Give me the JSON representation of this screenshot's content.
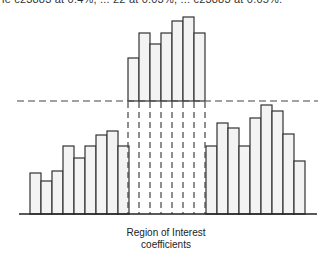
{
  "header": {
    "cropped_text": "ie c23883 at 0.4%, ... 22 at 0.03%, ... c23883 at 0.05%."
  },
  "caption": {
    "line1": "Region of Interest",
    "line2": "coefficients"
  },
  "colors": {
    "bar_fill": "#f3f3f3",
    "bar_stroke": "#333333",
    "dash": "#444444"
  },
  "chart_data": {
    "type": "bar",
    "title": "",
    "xlabel": "Region of Interest coefficients",
    "ylabel": "",
    "grid": false,
    "series": [
      {
        "name": "Background coefficients (left)",
        "values": [
          41,
          33,
          43,
          68,
          56,
          68,
          79,
          83,
          68
        ]
      },
      {
        "name": "Region of Interest coefficients (shifted)",
        "values": [
          43,
          68,
          57,
          68,
          80,
          84,
          68
        ],
        "offset": 113
      },
      {
        "name": "Background coefficients (right)",
        "values": [
          68,
          91,
          86,
          68,
          96,
          109,
          103,
          80,
          53
        ]
      }
    ],
    "threshold_line": 113,
    "ylim": [
      0,
      200
    ]
  }
}
